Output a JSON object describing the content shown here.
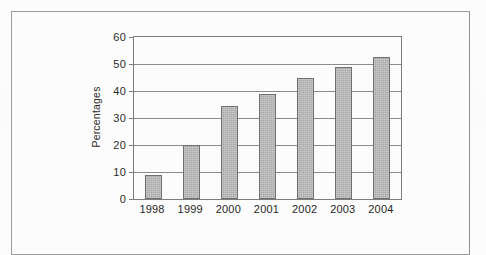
{
  "chart_data": {
    "type": "bar",
    "title": "",
    "xlabel": "",
    "ylabel": "Percentages",
    "categories": [
      "1998",
      "1999",
      "2000",
      "2001",
      "2002",
      "2003",
      "2004"
    ],
    "values": [
      9,
      20,
      34.5,
      39,
      45,
      49,
      52.5
    ],
    "ylim": [
      0,
      60
    ],
    "ytick_labels": [
      "0",
      "10",
      "20",
      "30",
      "40",
      "50",
      "60"
    ],
    "ytick_values": [
      0,
      10,
      20,
      30,
      40,
      50,
      60
    ],
    "grid": true,
    "legend": false,
    "series": [
      {
        "name": "Percentages",
        "values": [
          9,
          20,
          34.5,
          39,
          45,
          49,
          52.5
        ]
      }
    ]
  },
  "style": {
    "bar_fill": "#a9a9a9",
    "bar_border": "#6f6f6f",
    "grid_color": "#8a8a8a",
    "axis_color": "#7d7d7d",
    "frame_color": "#9c9c9c",
    "page_background": "#fdfdfd",
    "text_color": "#1f1f1f"
  }
}
